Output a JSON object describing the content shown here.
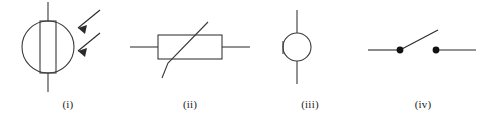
{
  "figure": {
    "background_color": "#ffffff",
    "stroke_color": "#3a3a3a",
    "label_color": "#222222",
    "width": 487,
    "height": 126
  },
  "symbols": [
    {
      "label": "(i)",
      "icon_name": "light-dependent-resistor-symbol",
      "component": "Light-dependent resistor (LDR)",
      "features": [
        "circle outline",
        "vertical rectangle resistor body inside circle",
        "vertical lead above circle",
        "vertical lead below circle",
        "two parallel arrows pointing in toward the circle from upper right"
      ],
      "arrow_count": 2
    },
    {
      "label": "(ii)",
      "icon_name": "thermistor-symbol",
      "component": "Thermistor",
      "features": [
        "horizontal rectangle resistor body",
        "horizontal lead on left",
        "horizontal lead on right",
        "diagonal line crossing the rectangle from lower left to upper right",
        "short vertical foot at the lower-left end of the diagonal"
      ],
      "arrow_count": 0
    },
    {
      "label": "(iii)",
      "icon_name": "lamp-symbol",
      "component": "Lamp",
      "features": [
        "plain circle outline",
        "vertical lead above circle",
        "vertical lead below circle",
        "short tick on left edge of circle"
      ],
      "arrow_count": 0
    },
    {
      "label": "(iv)",
      "icon_name": "open-switch-symbol",
      "component": "Open switch",
      "features": [
        "horizontal lead on left ending in a filled terminal dot",
        "filled terminal dot on right with horizontal lead",
        "lever line hinged at the left dot, angled up to the right, not touching the right dot"
      ],
      "arrow_count": 0
    }
  ]
}
